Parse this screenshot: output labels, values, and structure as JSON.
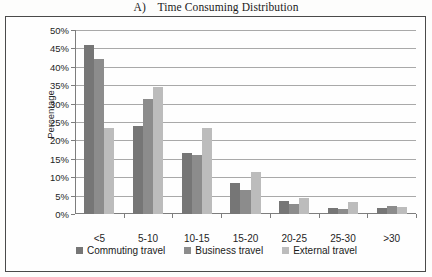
{
  "figure": {
    "label": "A)",
    "title": "A)    Time Consuming Distribution"
  },
  "axes": {
    "y_title": "Percentage",
    "x_unit": "km",
    "y_ticks": [
      "0%",
      "5%",
      "10%",
      "15%",
      "20%",
      "25%",
      "30%",
      "35%",
      "40%",
      "45%",
      "50%"
    ]
  },
  "legend": {
    "items": [
      {
        "label": "Commuting travel",
        "color": "#767676"
      },
      {
        "label": "Business travel",
        "color": "#8c8c8c"
      },
      {
        "label": "External travel",
        "color": "#bcbcbc"
      }
    ]
  },
  "chart_data": {
    "type": "bar",
    "title": "A)    Time Consuming Distribution",
    "xlabel": "km",
    "ylabel": "Percentage",
    "ylim": [
      0,
      50
    ],
    "ytick_step": 5,
    "ytick_format": "percent",
    "grid": true,
    "legend_position": "bottom",
    "categories": [
      "<5",
      "5-10",
      "10-15",
      "15-20",
      "20-25",
      "25-30",
      ">30"
    ],
    "series": [
      {
        "name": "Commuting travel",
        "color": "#767676",
        "values": [
          46,
          24,
          16.5,
          8.5,
          3.5,
          1.7,
          1.6
        ]
      },
      {
        "name": "Business travel",
        "color": "#8c8c8c",
        "values": [
          42,
          31.3,
          16,
          6.5,
          2.8,
          1.4,
          2.2
        ]
      },
      {
        "name": "External travel",
        "color": "#bcbcbc",
        "values": [
          23.3,
          34.5,
          23.5,
          11.5,
          4.3,
          3.3,
          2
        ]
      }
    ]
  }
}
